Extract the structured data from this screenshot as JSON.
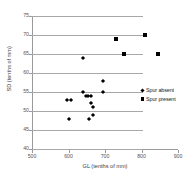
{
  "chart_data": {
    "type": "scatter",
    "title": "",
    "xlabel": "GL (tenths of mm)",
    "ylabel": "SD (tenths of mm)",
    "xlim": [
      500,
      900
    ],
    "ylim": [
      40,
      75
    ],
    "xticks": [
      500,
      600,
      700,
      800,
      900
    ],
    "yticks": [
      40,
      45,
      50,
      55,
      60,
      65,
      70,
      75
    ],
    "grid": "horizontal",
    "legend_position": "right-middle",
    "series": [
      {
        "name": "Spur absent",
        "marker": "diamond",
        "color": "#000000",
        "points": [
          [
            640,
            64
          ],
          [
            695,
            58
          ],
          [
            597,
            53
          ],
          [
            608,
            53
          ],
          [
            640,
            55
          ],
          [
            648,
            54
          ],
          [
            654,
            54
          ],
          [
            661,
            54
          ],
          [
            695,
            55
          ],
          [
            662,
            52
          ],
          [
            667,
            51
          ],
          [
            668,
            49
          ],
          [
            655,
            48
          ],
          [
            600,
            48
          ]
        ]
      },
      {
        "name": "Spur present",
        "marker": "square",
        "color": "#000000",
        "points": [
          [
            730,
            69
          ],
          [
            810,
            70
          ],
          [
            752,
            65
          ],
          [
            845,
            65
          ]
        ]
      }
    ]
  },
  "axes": {
    "y_tick_labels": [
      "75",
      "70",
      "65",
      "60",
      "55",
      "50",
      "45",
      "40"
    ],
    "x_tick_labels": [
      "500",
      "600",
      "700",
      "800",
      "900"
    ],
    "y_title": "SD (tenths of mm)",
    "x_title": "GL (tenths of mm)"
  },
  "legend": {
    "items": [
      {
        "label": "Spur absent",
        "marker": "diamond"
      },
      {
        "label": "Spur present",
        "marker": "square"
      }
    ]
  }
}
